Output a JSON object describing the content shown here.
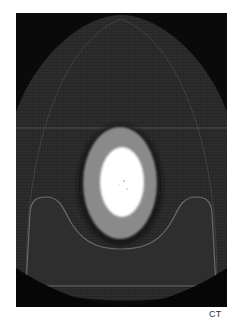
{
  "figure": {
    "modality_label": "CT"
  },
  "colors": {
    "background": "#ffffff",
    "scan_background": "#0a0a0a",
    "soft_tissue": "#2b2b2b",
    "ring": "#8a8a8a",
    "core": "#ffffff",
    "caption": "#333333"
  }
}
